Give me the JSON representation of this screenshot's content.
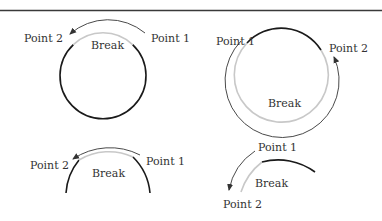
{
  "colors": {
    "rule": "#3a3a3a",
    "dark": "#1a1a1a",
    "break": "#c8c8c8",
    "arrow": "#4a4a4a",
    "text": "#333333"
  },
  "panels": [
    {
      "id": "full-circle-ccw",
      "labels": {
        "p1": "Point 1",
        "p2": "Point 2",
        "break": "Break"
      }
    },
    {
      "id": "full-circle-cw",
      "labels": {
        "p1": "Point 1",
        "p2": "Point 2",
        "break": "Break"
      }
    },
    {
      "id": "arc-ccw",
      "labels": {
        "p1": "Point 1",
        "p2": "Point 2",
        "break": "Break"
      }
    },
    {
      "id": "arc-cw",
      "labels": {
        "p1": "Point 1",
        "p2": "Point 2",
        "break": "Break"
      }
    }
  ]
}
